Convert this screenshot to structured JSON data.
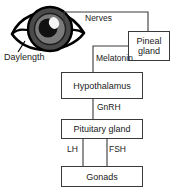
{
  "diagram": {
    "type": "flow-diagram",
    "colors": {
      "stroke": "#3a3a3a",
      "text": "#1a1a1a",
      "background": "#ffffff",
      "eye_outline": "#000000",
      "iris_outer": "#4a4a4a",
      "iris_inner": "#6e6e6e",
      "pupil": "#111111",
      "highlight": "#f2f2f2"
    },
    "source": {
      "icon": "eye-icon",
      "label": "Daylength"
    },
    "nodes": [
      {
        "id": "pineal",
        "label": "Pineal gland",
        "line1": "Pineal",
        "line2": "gland"
      },
      {
        "id": "hypothalamus",
        "label": "Hypothalamus"
      },
      {
        "id": "pituitary",
        "label": "Pituitary gland"
      },
      {
        "id": "gonads",
        "label": "Gonads"
      }
    ],
    "edges": [
      {
        "id": "nerves",
        "label": "Nerves",
        "from": "eye",
        "to": "pineal"
      },
      {
        "id": "melatonin",
        "label": "Melatonin",
        "from": "pineal",
        "to": "hypothalamus"
      },
      {
        "id": "gnrh",
        "label": "GnRH",
        "from": "hypothalamus",
        "to": "pituitary"
      },
      {
        "id": "lh",
        "label": "LH",
        "from": "pituitary",
        "to": "gonads"
      },
      {
        "id": "fsh",
        "label": "FSH",
        "from": "pituitary",
        "to": "gonads"
      }
    ]
  }
}
